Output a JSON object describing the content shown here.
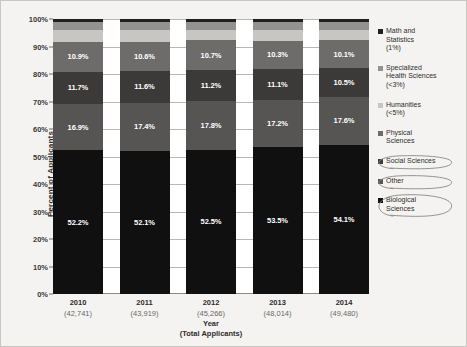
{
  "chart_data": {
    "type": "bar",
    "subtype": "100% stacked bar",
    "title": "",
    "xlabel": "Year\n(Total Applicants)",
    "ylabel": "Percent of Applicants",
    "ylim": [
      0,
      100
    ],
    "ytick_labels": [
      "100%",
      "90%",
      "80%",
      "70%",
      "60%",
      "50%",
      "40%",
      "30%",
      "20%",
      "10%",
      "0%"
    ],
    "ytick_values": [
      100,
      90,
      80,
      70,
      60,
      50,
      40,
      30,
      20,
      10,
      0
    ],
    "grid": true,
    "legend_position": "right",
    "categories": [
      "2010",
      "2011",
      "2012",
      "2013",
      "2014"
    ],
    "category_sublabels": [
      "(42,741)",
      "(43,919)",
      "(45,266)",
      "(48,014)",
      "(49,480)"
    ],
    "series": [
      {
        "name": "Math and Statistics",
        "legend_label": "Math and\nStatistics\n(1%)",
        "color": "#231f20",
        "values": [
          1.0,
          1.0,
          1.0,
          1.0,
          1.0
        ],
        "labels": [
          "",
          "",
          "",
          "",
          ""
        ]
      },
      {
        "name": "Specialized Health Sciences",
        "legend_label": "Specialized\nHealth Sciences\n(<3%)",
        "color": "#949290",
        "values": [
          2.9,
          2.9,
          2.9,
          2.9,
          2.9
        ],
        "labels": [
          "",
          "",
          "",
          "",
          ""
        ]
      },
      {
        "name": "Humanities",
        "legend_label": "Humanities\n(<5%)",
        "color": "#c8c6c3",
        "values": [
          4.4,
          4.4,
          3.9,
          4.0,
          3.8
        ],
        "labels": [
          "",
          "",
          "",
          "",
          ""
        ]
      },
      {
        "name": "Physical Sciences",
        "legend_label": "Physical\nSciences",
        "color": "#6e6c6a",
        "values": [
          10.9,
          10.6,
          10.7,
          10.3,
          10.1
        ],
        "labels": [
          "10.9%",
          "10.6%",
          "10.7%",
          "10.3%",
          "10.1%"
        ]
      },
      {
        "name": "Social Sciences",
        "legend_label": "Social Sciences",
        "color": "#3b3a39",
        "values": [
          11.7,
          11.6,
          11.2,
          11.1,
          10.5
        ],
        "labels": [
          "11.7%",
          "11.6%",
          "11.2%",
          "11.1%",
          "10.5%"
        ]
      },
      {
        "name": "Other",
        "legend_label": "Other",
        "color": "#565553",
        "values": [
          16.9,
          17.4,
          17.8,
          17.2,
          17.6
        ],
        "labels": [
          "16.9%",
          "17.4%",
          "17.8%",
          "17.2%",
          "17.6%"
        ]
      },
      {
        "name": "Biological Sciences",
        "legend_label": "Biological\nSciences",
        "color": "#101010",
        "values": [
          52.2,
          52.1,
          52.5,
          53.5,
          54.1
        ],
        "labels": [
          "52.2%",
          "52.1%",
          "52.5%",
          "53.5%",
          "54.1%"
        ]
      }
    ],
    "annotations": [
      {
        "type": "hand-drawn-ellipse",
        "target": "Social Sciences",
        "color": "#8a8885"
      },
      {
        "type": "hand-drawn-ellipse",
        "target": "Other",
        "color": "#8a8885"
      },
      {
        "type": "hand-drawn-ellipse",
        "target": "Biological Sciences",
        "color": "#8a8885"
      }
    ]
  }
}
